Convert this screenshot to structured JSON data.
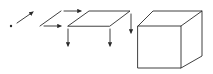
{
  "diagram": {
    "stroke_color": "#2a2a2a",
    "background": "#ffffff",
    "stages": [
      {
        "name": "point",
        "dimension": 0
      },
      {
        "name": "line",
        "dimension": 1
      },
      {
        "name": "plane",
        "dimension": 2
      },
      {
        "name": "cube",
        "dimension": 3
      }
    ],
    "arrows": [
      {
        "label": "point-extrusion",
        "direction": "up-right"
      },
      {
        "label": "line-extrusion-top",
        "direction": "right"
      },
      {
        "label": "line-extrusion-bottom",
        "direction": "right"
      },
      {
        "label": "plane-extrusion-left",
        "direction": "down"
      },
      {
        "label": "plane-extrusion-middle",
        "direction": "down"
      },
      {
        "label": "plane-extrusion-right",
        "direction": "down"
      }
    ]
  }
}
